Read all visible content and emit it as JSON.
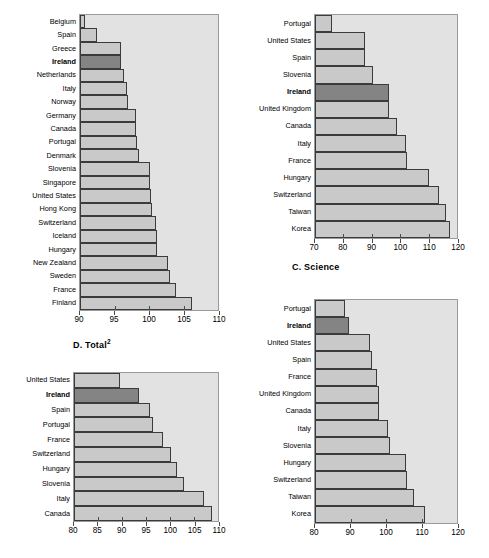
{
  "figure": {
    "background": "#ffffff",
    "bar_color": "#c9c9c9",
    "highlight_color": "#848484",
    "plot_background": "#e2e2e2",
    "border_color": "#3b3b3b",
    "highlight_category": "Ireland"
  },
  "panels": {
    "top_left": {
      "title": "",
      "caption": "D.  Total",
      "caption_sup": "2"
    },
    "top_right": {
      "caption": "C.  Science"
    },
    "bottom_left": {
      "caption": ""
    },
    "bottom_right": {
      "caption": ""
    }
  },
  "chart_data": [
    {
      "id": "panel-top-left",
      "type": "bar",
      "orientation": "horizontal",
      "title": "",
      "xlabel": "",
      "ylabel": "",
      "xlim": [
        90,
        110
      ],
      "xticks": [
        90,
        95,
        100,
        105,
        110
      ],
      "grid": false,
      "legend": "none",
      "highlight": "Ireland",
      "categories": [
        "Belgium",
        "Spain",
        "Greece",
        "Ireland",
        "Netherlands",
        "Italy",
        "Norway",
        "Germany",
        "Canada",
        "Portugal",
        "Denmark",
        "Slovenia",
        "Singapore",
        "United States",
        "Hong Kong",
        "Switzerland",
        "Iceland",
        "Hungary",
        "New Zealand",
        "Sweden",
        "France",
        "Finland"
      ],
      "values": [
        90.7,
        92.5,
        95.9,
        96.0,
        96.4,
        96.8,
        97.0,
        98.1,
        98.1,
        98.3,
        98.6,
        100.1,
        100.2,
        100.3,
        100.5,
        101.0,
        101.1,
        101.2,
        102.8,
        103.1,
        103.9,
        106.3
      ]
    },
    {
      "id": "panel-top-right",
      "type": "bar",
      "orientation": "horizontal",
      "title": "C.  Science",
      "xlabel": "",
      "ylabel": "",
      "xlim": [
        70,
        120
      ],
      "xticks": [
        70,
        80,
        90,
        100,
        110,
        120
      ],
      "grid": false,
      "legend": "none",
      "highlight": "Ireland",
      "categories": [
        "Portugal",
        "United States",
        "Spain",
        "Slovenia",
        "Ireland",
        "United Kingdom",
        "Canada",
        "Italy",
        "France",
        "Hungary",
        "Switzerland",
        "Taiwan",
        "Korea"
      ],
      "values": [
        76.0,
        87.5,
        87.5,
        90.5,
        96.0,
        96.0,
        99.0,
        102.0,
        102.5,
        110.0,
        113.5,
        116.0,
        117.5
      ]
    },
    {
      "id": "panel-bottom-left",
      "type": "bar",
      "orientation": "horizontal",
      "title": "D.  Total2",
      "xlabel": "",
      "ylabel": "",
      "xlim": [
        80,
        110
      ],
      "xticks": [
        80,
        85,
        90,
        95,
        100,
        105,
        110
      ],
      "grid": false,
      "legend": "none",
      "highlight": "Ireland",
      "categories": [
        "United States",
        "Ireland",
        "Spain",
        "Portugal",
        "France",
        "Switzerland",
        "Hungary",
        "Slovenia",
        "Italy",
        "Canada"
      ],
      "values": [
        89.5,
        93.5,
        95.8,
        96.5,
        98.6,
        100.2,
        101.5,
        103.0,
        107.0,
        108.8
      ]
    },
    {
      "id": "panel-bottom-right",
      "type": "bar",
      "orientation": "horizontal",
      "title": "",
      "xlabel": "",
      "ylabel": "",
      "xlim": [
        80,
        120
      ],
      "xticks": [
        80,
        90,
        100,
        110,
        120
      ],
      "grid": false,
      "legend": "none",
      "highlight": "Ireland",
      "categories": [
        "Portugal",
        "Ireland",
        "United States",
        "Spain",
        "France",
        "United Kingdom",
        "Canada",
        "Italy",
        "Slovenia",
        "Hungary",
        "Switzerland",
        "Taiwan",
        "Korea"
      ],
      "values": [
        88.5,
        89.5,
        95.5,
        96.0,
        97.5,
        98.0,
        98.0,
        100.5,
        101.0,
        105.5,
        106.0,
        108.0,
        111.0
      ]
    }
  ]
}
